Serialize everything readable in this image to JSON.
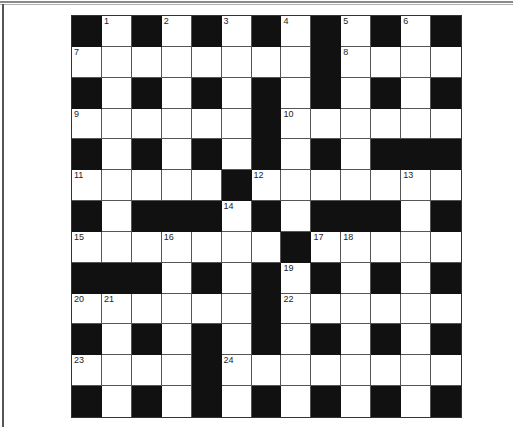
{
  "puzzle": {
    "rows": 13,
    "cols": 13,
    "grid": [
      "#.#.#.#.#.#.#",
      "........#....",
      "#.#.#.#.#.#.#",
      "......#......",
      "#.#.#.#.#.###",
      ".....#.......",
      "#.###.#.###.#",
      ".......#.....",
      "###.#.#.#.#.#",
      "......#......",
      "#.#.#.#.#.#.#",
      "....#........",
      "#.#.#.#.#.#.#"
    ],
    "numbers": [
      {
        "n": "1",
        "r": 0,
        "c": 1
      },
      {
        "n": "2",
        "r": 0,
        "c": 3
      },
      {
        "n": "3",
        "r": 0,
        "c": 5
      },
      {
        "n": "4",
        "r": 0,
        "c": 7
      },
      {
        "n": "5",
        "r": 0,
        "c": 9
      },
      {
        "n": "6",
        "r": 0,
        "c": 11
      },
      {
        "n": "7",
        "r": 1,
        "c": 0
      },
      {
        "n": "8",
        "r": 1,
        "c": 9
      },
      {
        "n": "9",
        "r": 3,
        "c": 0
      },
      {
        "n": "10",
        "r": 3,
        "c": 7
      },
      {
        "n": "11",
        "r": 5,
        "c": 0
      },
      {
        "n": "12",
        "r": 5,
        "c": 6
      },
      {
        "n": "13",
        "r": 5,
        "c": 11
      },
      {
        "n": "14",
        "r": 6,
        "c": 5
      },
      {
        "n": "15",
        "r": 7,
        "c": 0
      },
      {
        "n": "16",
        "r": 7,
        "c": 3
      },
      {
        "n": "17",
        "r": 7,
        "c": 8
      },
      {
        "n": "18",
        "r": 7,
        "c": 9
      },
      {
        "n": "19",
        "r": 8,
        "c": 7
      },
      {
        "n": "20",
        "r": 9,
        "c": 0
      },
      {
        "n": "21",
        "r": 9,
        "c": 1
      },
      {
        "n": "22",
        "r": 9,
        "c": 7
      },
      {
        "n": "23",
        "r": 11,
        "c": 0
      },
      {
        "n": "24",
        "r": 11,
        "c": 5
      }
    ]
  },
  "colors": {
    "block": "#111111",
    "cell": "#ffffff",
    "line": "#555555"
  }
}
